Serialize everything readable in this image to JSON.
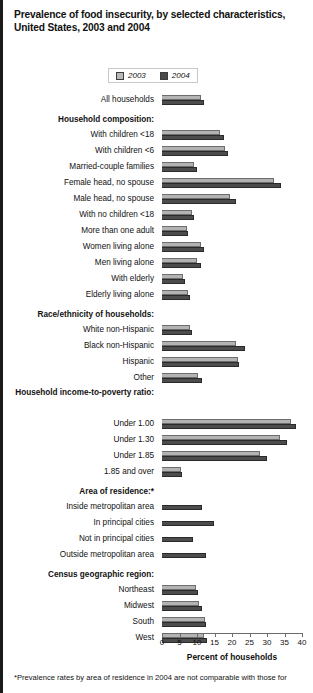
{
  "title": "Prevalence of food insecurity, by selected characteristics, United States, 2003 and 2004",
  "legend": {
    "items": [
      {
        "label": "2003",
        "color": "#b3b3b3"
      },
      {
        "label": "2004",
        "color": "#4c4c4c"
      }
    ]
  },
  "axis": {
    "xlabel": "Percent of households",
    "ticks": [
      "0",
      "5",
      "10",
      "15",
      "20",
      "25",
      "30",
      "35",
      "40"
    ]
  },
  "footnote": "*Prevalence rates by area of residence in 2004 are not comparable with those for",
  "chart_data": {
    "type": "bar",
    "orientation": "horizontal",
    "title": "Prevalence of food insecurity, by selected characteristics, United States, 2003 and 2004",
    "xlabel": "Percent of households",
    "ylabel": "",
    "xlim": [
      0,
      40
    ],
    "grid": false,
    "legend_position": "top",
    "series": [
      {
        "name": "2003",
        "color": "#b3b3b3"
      },
      {
        "name": "2004",
        "color": "#4c4c4c"
      }
    ],
    "rows": [
      {
        "label": "All households",
        "type": "bar",
        "values": [
          11.2,
          11.9
        ]
      },
      {
        "label": "Household composition:",
        "type": "heading",
        "values": [
          null,
          null
        ]
      },
      {
        "label": "With children <18",
        "type": "bar",
        "values": [
          16.7,
          17.6
        ]
      },
      {
        "label": "With children <6",
        "type": "bar",
        "values": [
          17.9,
          18.8
        ]
      },
      {
        "label": "Married-couple families",
        "type": "bar",
        "values": [
          9.2,
          9.9
        ]
      },
      {
        "label": "Female head, no spouse",
        "type": "bar",
        "values": [
          32.0,
          33.9
        ]
      },
      {
        "label": "Male head, no spouse",
        "type": "bar",
        "values": [
          19.5,
          21.0
        ]
      },
      {
        "label": "With no children <18",
        "type": "bar",
        "values": [
          8.5,
          9.0
        ]
      },
      {
        "label": "More than one adult",
        "type": "bar",
        "values": [
          7.0,
          7.4
        ]
      },
      {
        "label": "Women living alone",
        "type": "bar",
        "values": [
          11.2,
          12.0
        ]
      },
      {
        "label": "Men living alone",
        "type": "bar",
        "values": [
          10.0,
          11.0
        ]
      },
      {
        "label": "With elderly",
        "type": "bar",
        "values": [
          6.0,
          6.5
        ]
      },
      {
        "label": "Elderly living alone",
        "type": "bar",
        "values": [
          7.3,
          8.0
        ]
      },
      {
        "label": "Race/ethnicity of households:",
        "type": "heading",
        "values": [
          null,
          null
        ]
      },
      {
        "label": "White non-Hispanic",
        "type": "bar",
        "values": [
          8.0,
          8.6
        ]
      },
      {
        "label": "Black non-Hispanic",
        "type": "bar",
        "values": [
          21.0,
          23.7
        ]
      },
      {
        "label": "Hispanic",
        "type": "bar",
        "values": [
          21.7,
          21.9
        ]
      },
      {
        "label": "Other",
        "type": "bar",
        "values": [
          10.3,
          11.3
        ]
      },
      {
        "label": "Household income-to-poverty ratio:",
        "type": "heading2",
        "values": [
          null,
          null
        ]
      },
      {
        "label": "Under 1.00",
        "type": "bar",
        "values": [
          36.8,
          38.2
        ]
      },
      {
        "label": "Under 1.30",
        "type": "bar",
        "values": [
          33.6,
          35.8
        ]
      },
      {
        "label": "Under 1.85",
        "type": "bar",
        "values": [
          28.1,
          29.9
        ]
      },
      {
        "label": "1.85 and over",
        "type": "bar",
        "values": [
          5.5,
          5.8
        ]
      },
      {
        "label": "Area of residence:*",
        "type": "heading",
        "values": [
          null,
          null
        ]
      },
      {
        "label": "Inside metropolitan area",
        "type": "bar",
        "values": [
          null,
          11.5
        ]
      },
      {
        "label": "In principal cities",
        "type": "bar",
        "values": [
          null,
          14.9
        ]
      },
      {
        "label": "Not in principal cities",
        "type": "bar",
        "values": [
          null,
          8.8
        ]
      },
      {
        "label": "Outside metropolitan area",
        "type": "bar",
        "values": [
          null,
          12.5
        ]
      },
      {
        "label": "Census geographic region:",
        "type": "heading",
        "values": [
          null,
          null
        ]
      },
      {
        "label": "Northeast",
        "type": "bar",
        "values": [
          9.6,
          10.2
        ]
      },
      {
        "label": "Midwest",
        "type": "bar",
        "values": [
          10.5,
          11.3
        ]
      },
      {
        "label": "South",
        "type": "bar",
        "values": [
          12.4,
          12.7
        ]
      },
      {
        "label": "West",
        "type": "bar",
        "values": [
          12.0,
          12.8
        ]
      }
    ]
  }
}
